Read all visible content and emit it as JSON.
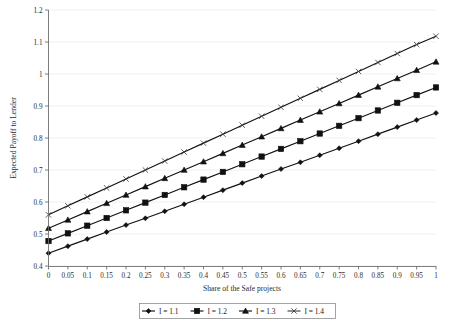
{
  "chart_data": {
    "type": "line",
    "title": "",
    "xlabel": "Share of the Safe projects",
    "ylabel": "Expected Payoff to Lender",
    "xlim": [
      0,
      1
    ],
    "ylim": [
      0.4,
      1.2
    ],
    "grid": true,
    "legend_position": "bottom",
    "x": [
      0,
      0.05,
      0.1,
      0.15,
      0.2,
      0.25,
      0.3,
      0.35,
      0.4,
      0.45,
      0.5,
      0.55,
      0.6,
      0.65,
      0.7,
      0.75,
      0.8,
      0.85,
      0.9,
      0.95,
      1
    ],
    "xticklabels": [
      "0",
      "0.05",
      "0.1",
      "0.15",
      "0.2",
      "0.25",
      "0.3",
      "0.35",
      "0.4",
      "0.45",
      "0.5",
      "0.55",
      "0.6",
      "0.65",
      "0.7",
      "0.75",
      "0.8",
      "0.85",
      "0.9",
      "0.95",
      "1"
    ],
    "yticks": [
      0.4,
      0.5,
      0.6,
      0.7,
      0.8,
      0.9,
      1.0,
      1.1,
      1.2
    ],
    "yticklabels": [
      "0.4",
      "0.5",
      "0.6",
      "0.7",
      "0.8",
      "0.9",
      "1",
      "1.1",
      "1.2"
    ],
    "series": [
      {
        "name": "I = 1.1",
        "marker": "diamond",
        "color": "#111111",
        "values": [
          0.44,
          0.462,
          0.484,
          0.506,
          0.528,
          0.549,
          0.571,
          0.593,
          0.615,
          0.637,
          0.659,
          0.681,
          0.703,
          0.724,
          0.746,
          0.768,
          0.79,
          0.812,
          0.834,
          0.856,
          0.878
        ]
      },
      {
        "name": "I = 1.2",
        "marker": "square",
        "color": "#111111",
        "values": [
          0.478,
          0.502,
          0.526,
          0.55,
          0.574,
          0.598,
          0.622,
          0.646,
          0.67,
          0.694,
          0.718,
          0.742,
          0.766,
          0.79,
          0.814,
          0.838,
          0.862,
          0.886,
          0.91,
          0.934,
          0.958
        ]
      },
      {
        "name": "I = 1.3",
        "marker": "triangle",
        "color": "#111111",
        "values": [
          0.518,
          0.544,
          0.57,
          0.596,
          0.622,
          0.648,
          0.674,
          0.7,
          0.726,
          0.752,
          0.778,
          0.804,
          0.83,
          0.856,
          0.882,
          0.908,
          0.934,
          0.96,
          0.986,
          1.012,
          1.038
        ]
      },
      {
        "name": "I = 1.4",
        "marker": "cross",
        "color": "#3f3f3f",
        "values": [
          0.56,
          0.588,
          0.616,
          0.644,
          0.672,
          0.7,
          0.728,
          0.756,
          0.784,
          0.812,
          0.84,
          0.868,
          0.896,
          0.924,
          0.952,
          0.98,
          1.008,
          1.036,
          1.064,
          1.092,
          1.118
        ]
      }
    ]
  },
  "legend": {
    "items": [
      {
        "label": "I = 1.1",
        "marker": "diamond"
      },
      {
        "label": "I = 1.2",
        "marker": "square"
      },
      {
        "label": "I = 1.3",
        "marker": "triangle"
      },
      {
        "label": "I = 1.4",
        "marker": "cross"
      }
    ]
  }
}
